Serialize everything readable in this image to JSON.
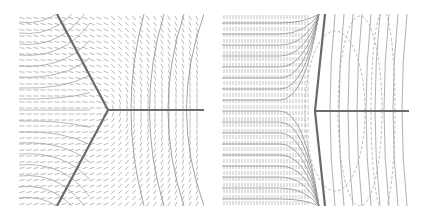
{
  "figure": {
    "panels": [
      {
        "id": "left",
        "description": "Triple-junction with three boundaries meeting at 120 degrees; dashed director field and curved integral lines",
        "junction": [
          89,
          96
        ],
        "boundaries": [
          [
            [
              0,
              96
            ],
            [
              89,
              96
            ]
          ],
          [
            [
              89,
              96
            ],
            [
              57,
              0
            ]
          ],
          [
            [
              89,
              96
            ],
            [
              57,
              192
            ]
          ]
        ],
        "boundary_color": "#6a6a6a",
        "field_color": "#a8a8a8"
      },
      {
        "id": "right",
        "description": "Asymmetric junction: vertical curved boundary on left with horizontal branch to the right; dense vertical dashes on left, solid streamlines and dashed ellipses on right",
        "junction": [
          93,
          97
        ],
        "boundary_color": "#6a6a6a",
        "field_color": "#a8a8a8"
      }
    ]
  }
}
